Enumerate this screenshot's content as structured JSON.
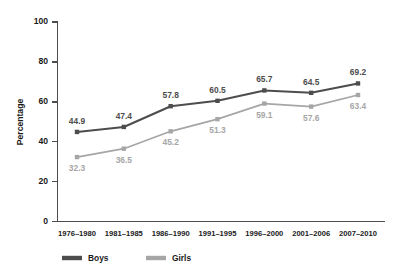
{
  "chart_data": {
    "type": "line",
    "title": "",
    "xlabel": "",
    "ylabel": "Percentage",
    "ylim": [
      0,
      100
    ],
    "yticks": [
      0,
      20,
      40,
      60,
      80,
      100
    ],
    "grid": false,
    "legend_position": "bottom-left",
    "categories": [
      "1976–1980",
      "1981–1985",
      "1986–1990",
      "1991–1995",
      "1996–2000",
      "2001–2006",
      "2007–2010"
    ],
    "series": [
      {
        "name": "Boys",
        "color": "#4d4d4d",
        "values": [
          44.9,
          47.4,
          57.8,
          60.5,
          65.7,
          64.5,
          69.2
        ],
        "labels": [
          "44.9",
          "47.4",
          "57.8",
          "60.5",
          "65.7",
          "64.5",
          "69.2"
        ]
      },
      {
        "name": "Girls",
        "color": "#a6a6a6",
        "values": [
          32.3,
          36.5,
          45.2,
          51.3,
          59.1,
          57.6,
          63.4
        ],
        "labels": [
          "32.3",
          "36.5",
          "45.2",
          "51.3",
          "59.1",
          "57.6",
          "63.4"
        ]
      }
    ]
  },
  "axis": {
    "y_title": "Percentage",
    "y_tick_labels": [
      "0",
      "20",
      "40",
      "60",
      "80",
      "100"
    ]
  },
  "legend": {
    "items": [
      {
        "label": "Boys",
        "color": "#4d4d4d"
      },
      {
        "label": "Girls",
        "color": "#a6a6a6"
      }
    ]
  }
}
